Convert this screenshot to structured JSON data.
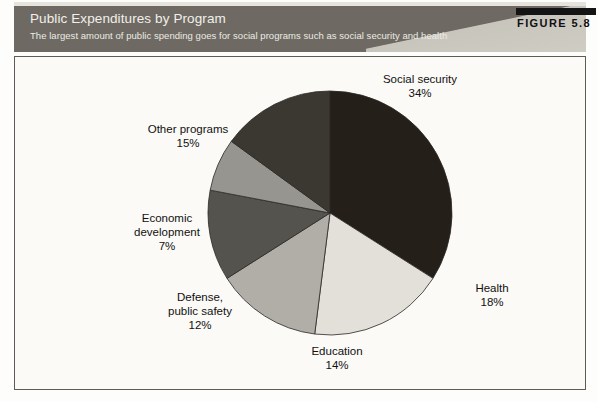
{
  "header": {
    "title": "Public Expenditures by Program",
    "subtitle": "The largest amount of public spending goes for social programs such as social security and health",
    "figure_label": "FIGURE 5.8",
    "band_color": "#6e6a63",
    "title_color": "#f2f0ea"
  },
  "chart_data": {
    "type": "pie",
    "title": "Public Expenditures by Program",
    "subtitle": "The largest amount of public spending goes for social programs such as social security and health",
    "unit": "percent",
    "start_angle_deg": 0,
    "direction": "clockwise",
    "categories": [
      "Social security",
      "Health",
      "Education",
      "Defense, public safety",
      "Economic development",
      "Other programs"
    ],
    "values": [
      34,
      18,
      14,
      12,
      7,
      15
    ],
    "colors": [
      "#241f19",
      "#e2e0d9",
      "#b0aea6",
      "#55534e",
      "#979590",
      "#3b3832"
    ],
    "slices": [
      {
        "label": "Social security",
        "label_line1": "Social security",
        "label_line2": "",
        "value": 34,
        "value_text": "34%",
        "color": "#241f19"
      },
      {
        "label": "Health",
        "label_line1": "Health",
        "label_line2": "",
        "value": 18,
        "value_text": "18%",
        "color": "#e2e0d9"
      },
      {
        "label": "Education",
        "label_line1": "Education",
        "label_line2": "",
        "value": 14,
        "value_text": "14%",
        "color": "#b0aea6"
      },
      {
        "label": "Defense, public safety",
        "label_line1": "Defense,",
        "label_line2": "public safety",
        "value": 12,
        "value_text": "12%",
        "color": "#55534e"
      },
      {
        "label": "Economic development",
        "label_line1": "Economic",
        "label_line2": "development",
        "value": 7,
        "value_text": "7%",
        "color": "#979590"
      },
      {
        "label": "Other programs",
        "label_line1": "Other programs",
        "label_line2": "",
        "value": 15,
        "value_text": "15%",
        "color": "#3b3832"
      }
    ],
    "legend": "none",
    "grid": false,
    "total": 100
  }
}
